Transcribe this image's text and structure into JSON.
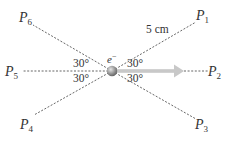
{
  "figure": {
    "charge": {
      "label": "e",
      "superscript": "−"
    },
    "distance_label": "5 cm",
    "angle_labels": [
      "30°",
      "30°",
      "30°",
      "30°"
    ],
    "points": [
      {
        "letter": "P",
        "sub": "1"
      },
      {
        "letter": "P",
        "sub": "2"
      },
      {
        "letter": "P",
        "sub": "3"
      },
      {
        "letter": "P",
        "sub": "4"
      },
      {
        "letter": "P",
        "sub": "5"
      },
      {
        "letter": "P",
        "sub": "6"
      }
    ],
    "velocity_arrow": {
      "direction": "right",
      "color": "#c8c8c8"
    },
    "charge_color": "#8a8a8a"
  }
}
